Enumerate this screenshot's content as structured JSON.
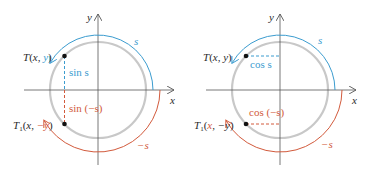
{
  "colors": {
    "circle": "#c8c8c8",
    "axis": "#555555",
    "positive_arc": "#3b9ccf",
    "negative_arc": "#d25a3c",
    "point": "#111111"
  },
  "left_panel": {
    "title": "sine symmetry",
    "axis_x_label": "x",
    "axis_y_label": "y",
    "arc_positive_label": "s",
    "arc_negative_label": "−s",
    "point_T": {
      "name": "T",
      "open": "(",
      "x": "x",
      "sep": ", ",
      "y": "y",
      "close": ")"
    },
    "point_T1": {
      "name": "T",
      "sub": "1",
      "open": "(",
      "x": "x",
      "sep": ", ",
      "y": "−y",
      "close": ")"
    },
    "segment_positive_label": "sin s",
    "segment_negative_label": "sin (−s)"
  },
  "right_panel": {
    "title": "cosine symmetry",
    "axis_x_label": "x",
    "axis_y_label": "y",
    "arc_positive_label": "s",
    "arc_negative_label": "−s",
    "point_T": {
      "name": "T",
      "open": "(",
      "x": "x",
      "sep": ", ",
      "y": "y",
      "close": ")"
    },
    "point_T1": {
      "name": "T",
      "sub": "1",
      "open": "(",
      "x": "x",
      "sep": ", ",
      "y": "−y",
      "close": ")"
    },
    "segment_positive_label": "cos s",
    "segment_negative_label": "cos (−s)"
  }
}
